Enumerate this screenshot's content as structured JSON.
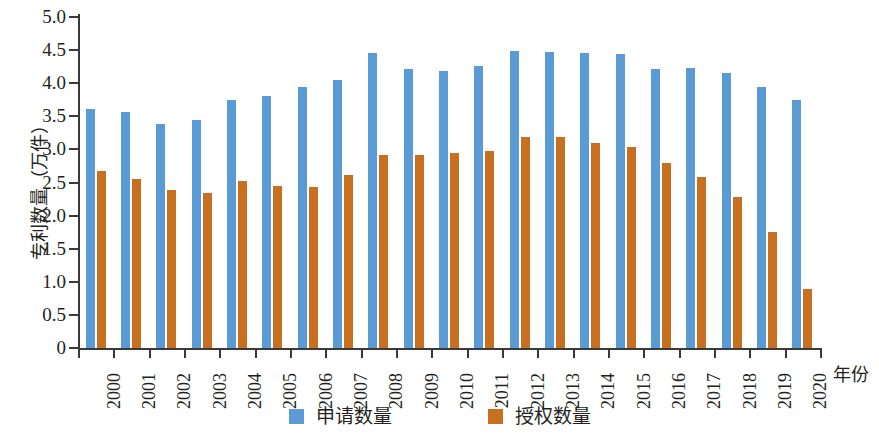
{
  "chart_data": {
    "type": "bar",
    "title": "",
    "xlabel": "年份",
    "ylabel": "专利数量（万件）",
    "categories": [
      "2000",
      "2001",
      "2002",
      "2003",
      "2004",
      "2005",
      "2006",
      "2007",
      "2008",
      "2009",
      "2010",
      "2011",
      "2012",
      "2013",
      "2014",
      "2015",
      "2016",
      "2017",
      "2018",
      "2019",
      "2020"
    ],
    "series": [
      {
        "name": "申请数量",
        "color": "#5b9bd5",
        "values": [
          3.61,
          3.56,
          3.39,
          3.44,
          3.74,
          3.8,
          3.95,
          4.05,
          4.45,
          4.22,
          4.18,
          4.26,
          4.49,
          4.47,
          4.46,
          4.44,
          4.21,
          4.23,
          4.16,
          3.95,
          3.75
        ]
      },
      {
        "name": "授权数量",
        "color": "#c8701f",
        "values": [
          2.67,
          2.55,
          2.38,
          2.34,
          2.53,
          2.45,
          2.44,
          2.62,
          2.92,
          2.91,
          2.94,
          2.98,
          3.19,
          3.19,
          3.1,
          3.04,
          2.8,
          2.58,
          2.28,
          1.76,
          0.89
        ]
      }
    ],
    "ylim": [
      0,
      5.0
    ],
    "yticks": [
      "0",
      "0.5",
      "1.0",
      "1.5",
      "2.0",
      "2.5",
      "3.0",
      "3.5",
      "4.0",
      "4.5",
      "5.0"
    ],
    "ytick_values": [
      0,
      0.5,
      1.0,
      1.5,
      2.0,
      2.5,
      3.0,
      3.5,
      4.0,
      4.5,
      5.0
    ],
    "grid": false,
    "legend_position": "bottom"
  },
  "legend": {
    "items": [
      {
        "label": "申请数量",
        "color": "#5b9bd5"
      },
      {
        "label": "授权数量",
        "color": "#c8701f"
      }
    ]
  }
}
